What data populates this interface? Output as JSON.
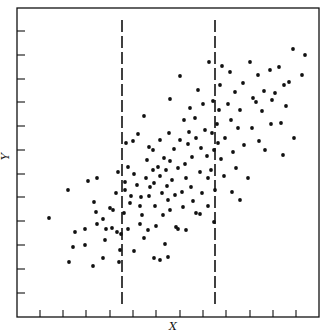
{
  "chart_data": {
    "type": "scatter",
    "title": "",
    "xlabel": "X",
    "ylabel": "Y",
    "grid": false,
    "legend": null,
    "frame_px": {
      "left": 17,
      "top": 8,
      "right": 319,
      "bottom": 317
    },
    "x_ticks_px": [
      40,
      63,
      86,
      110,
      133,
      156,
      180,
      203,
      226,
      250,
      273,
      296
    ],
    "y_ticks_px": [
      31,
      55,
      79,
      102,
      126,
      150,
      174,
      197,
      221,
      245,
      269,
      293
    ],
    "tick_labels": "none (unlabeled ticks)",
    "xlim": [
      0,
      13
    ],
    "ylim": [
      0,
      13
    ],
    "vertical_dashed_lines_px": [
      122,
      215
    ],
    "annotations": [
      "Two vertical dashed lines dividing X into bands"
    ],
    "points_px": [
      [
        49,
        218
      ],
      [
        68,
        190
      ],
      [
        73,
        247
      ],
      [
        75,
        232
      ],
      [
        69,
        262
      ],
      [
        85,
        229
      ],
      [
        88,
        181
      ],
      [
        85,
        245
      ],
      [
        96,
        212
      ],
      [
        97,
        178
      ],
      [
        97,
        224
      ],
      [
        94,
        202
      ],
      [
        103,
        219
      ],
      [
        105,
        240
      ],
      [
        106,
        229
      ],
      [
        112,
        228
      ],
      [
        103,
        258
      ],
      [
        117,
        232
      ],
      [
        119,
        262
      ],
      [
        120,
        250
      ],
      [
        121,
        234
      ],
      [
        125,
        182
      ],
      [
        128,
        167
      ],
      [
        130,
        203
      ],
      [
        125,
        190
      ],
      [
        124,
        213
      ],
      [
        128,
        229
      ],
      [
        131,
        196
      ],
      [
        134,
        174
      ],
      [
        137,
        185
      ],
      [
        140,
        206
      ],
      [
        141,
        197
      ],
      [
        140,
        224
      ],
      [
        142,
        215
      ],
      [
        146,
        178
      ],
      [
        147,
        160
      ],
      [
        149,
        147
      ],
      [
        149,
        196
      ],
      [
        148,
        230
      ],
      [
        150,
        187
      ],
      [
        153,
        150
      ],
      [
        153,
        170
      ],
      [
        154,
        183
      ],
      [
        155,
        206
      ],
      [
        156,
        226
      ],
      [
        158,
        167
      ],
      [
        160,
        140
      ],
      [
        160,
        176
      ],
      [
        162,
        193
      ],
      [
        163,
        215
      ],
      [
        164,
        158
      ],
      [
        165,
        244
      ],
      [
        166,
        170
      ],
      [
        167,
        186
      ],
      [
        168,
        200
      ],
      [
        169,
        133
      ],
      [
        170,
        161
      ],
      [
        170,
        210
      ],
      [
        172,
        180
      ],
      [
        174,
        149
      ],
      [
        175,
        195
      ],
      [
        176,
        227
      ],
      [
        178,
        168
      ],
      [
        180,
        76
      ],
      [
        180,
        140
      ],
      [
        182,
        192
      ],
      [
        183,
        207
      ],
      [
        184,
        120
      ],
      [
        185,
        164
      ],
      [
        186,
        178
      ],
      [
        188,
        144
      ],
      [
        189,
        132
      ],
      [
        190,
        108
      ],
      [
        191,
        187
      ],
      [
        192,
        157
      ],
      [
        193,
        201
      ],
      [
        195,
        118
      ],
      [
        196,
        213
      ],
      [
        196,
        138
      ],
      [
        198,
        90
      ],
      [
        200,
        172
      ],
      [
        201,
        148
      ],
      [
        202,
        193
      ],
      [
        203,
        104
      ],
      [
        205,
        130
      ],
      [
        207,
        156
      ],
      [
        208,
        178
      ],
      [
        209,
        62
      ],
      [
        211,
        170
      ],
      [
        212,
        133
      ],
      [
        213,
        101
      ],
      [
        214,
        150
      ],
      [
        215,
        190
      ],
      [
        217,
        124
      ],
      [
        218,
        143
      ],
      [
        219,
        110
      ],
      [
        220,
        85
      ],
      [
        221,
        159
      ],
      [
        222,
        66
      ],
      [
        224,
        176
      ],
      [
        225,
        138
      ],
      [
        228,
        104
      ],
      [
        230,
        72
      ],
      [
        231,
        120
      ],
      [
        233,
        152
      ],
      [
        235,
        92
      ],
      [
        236,
        168
      ],
      [
        238,
        128
      ],
      [
        240,
        110
      ],
      [
        243,
        83
      ],
      [
        244,
        145
      ],
      [
        248,
        178
      ],
      [
        250,
        62
      ],
      [
        252,
        128
      ],
      [
        253,
        98
      ],
      [
        256,
        102
      ],
      [
        258,
        75
      ],
      [
        259,
        141
      ],
      [
        262,
        111
      ],
      [
        264,
        91
      ],
      [
        265,
        150
      ],
      [
        270,
        70
      ],
      [
        271,
        124
      ],
      [
        272,
        100
      ],
      [
        275,
        93
      ],
      [
        279,
        67
      ],
      [
        281,
        123
      ],
      [
        283,
        155
      ],
      [
        284,
        85
      ],
      [
        286,
        106
      ],
      [
        289,
        82
      ],
      [
        293,
        49
      ],
      [
        294,
        138
      ],
      [
        302,
        75
      ],
      [
        305,
        55
      ],
      [
        116,
        193
      ],
      [
        110,
        208
      ],
      [
        118,
        172
      ],
      [
        93,
        266
      ],
      [
        113,
        210
      ],
      [
        134,
        251
      ],
      [
        154,
        258
      ],
      [
        160,
        260
      ],
      [
        144,
        238
      ],
      [
        178,
        229
      ],
      [
        168,
        257
      ],
      [
        133,
        141
      ],
      [
        126,
        143
      ],
      [
        200,
        214
      ],
      [
        186,
        230
      ],
      [
        208,
        206
      ],
      [
        144,
        116
      ],
      [
        138,
        134
      ],
      [
        170,
        99
      ],
      [
        214,
        222
      ],
      [
        232,
        192
      ],
      [
        240,
        200
      ]
    ]
  }
}
